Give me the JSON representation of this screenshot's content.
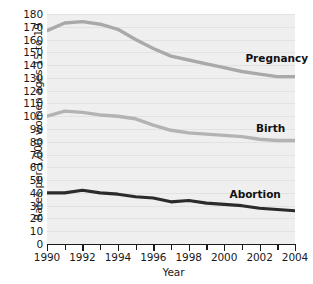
{
  "chart_data": {
    "type": "line",
    "title": "",
    "xlabel": "Year",
    "ylabel": "Rates per 1,000 women ages 15 to 19",
    "x": [
      1990,
      1991,
      1992,
      1993,
      1994,
      1995,
      1996,
      1997,
      1998,
      1999,
      2000,
      2001,
      2002,
      2003,
      2004
    ],
    "xlim": [
      1990,
      2004
    ],
    "ylim": [
      0,
      180
    ],
    "ytick_step": 10,
    "yticks": [
      0,
      10,
      20,
      30,
      40,
      50,
      60,
      70,
      80,
      90,
      100,
      110,
      120,
      130,
      140,
      150,
      160,
      170,
      180
    ],
    "xticks_major": [
      1990,
      1992,
      1994,
      1996,
      1998,
      2000,
      2002,
      2004
    ],
    "xticks_minor": [
      1991,
      1993,
      1995,
      1997,
      1999,
      2001,
      2003
    ],
    "grid": "horizontal",
    "legend_position": "inline-annotations",
    "series": [
      {
        "name": "Pregnancy",
        "color": "#a9a9a9",
        "values": [
          167,
          173,
          174,
          172,
          168,
          160,
          153,
          147,
          144,
          141,
          138,
          135,
          133,
          131,
          131
        ],
        "label_x": 2001.2,
        "label_y": 145
      },
      {
        "name": "Birth",
        "color": "#b3b3b3",
        "values": [
          100,
          104,
          103,
          101,
          100,
          98,
          93,
          89,
          87,
          86,
          85,
          84,
          82,
          81,
          81
        ],
        "label_x": 2001.8,
        "label_y": 90
      },
      {
        "name": "Abortion",
        "color": "#2b2b2b",
        "values": [
          40,
          40,
          42,
          40,
          39,
          37,
          36,
          33,
          34,
          32,
          31,
          30,
          28,
          27,
          26
        ],
        "label_x": 2000.3,
        "label_y": 38
      }
    ]
  },
  "axes": {
    "ytick_labels": [
      "180",
      "170",
      "160",
      "150",
      "140",
      "130",
      "120",
      "110",
      "100",
      "90",
      "80",
      "70",
      "60",
      "50",
      "40",
      "30",
      "20",
      "10",
      "0"
    ],
    "xtick_labels": [
      "1990",
      "1992",
      "1994",
      "1996",
      "1998",
      "2000",
      "2002",
      "2004"
    ],
    "x_title": "Year",
    "y_title": "Rates per 1,000 women ages 15 to 19"
  },
  "colors": {
    "panel_background": "#efefef",
    "gridline": "#e2e2e2",
    "axis": "#1a1a1a",
    "page_background": "#ffffff"
  }
}
